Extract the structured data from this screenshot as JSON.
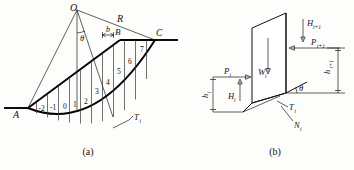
{
  "figure": {
    "title_a": "(a)",
    "title_b": "(b)"
  },
  "panel_a": {
    "caption": "(a)",
    "points": {
      "center": "O",
      "toe": "A",
      "crest_break": "B",
      "crest_top": "C"
    },
    "labels": {
      "radius": "R",
      "angle": "θ",
      "slice_width": "b",
      "shear_force": "T",
      "shear_force_sub": "i"
    },
    "slice_numbers": [
      "-2",
      "-1",
      "0",
      "1",
      "2",
      "3",
      "4",
      "5",
      "6",
      "7"
    ]
  },
  "panel_b": {
    "caption": "(b)",
    "forces": [
      {
        "symbol": "H",
        "sub": "i+1",
        "name": "horizontal-force-right"
      },
      {
        "symbol": "P",
        "sub": "i+1",
        "name": "interslice-force-right"
      },
      {
        "symbol": "h",
        "sub": "i+1",
        "name": "height-right"
      },
      {
        "symbol": "P",
        "sub": "i",
        "name": "interslice-force-left"
      },
      {
        "symbol": "h",
        "sub": "i",
        "name": "height-left"
      },
      {
        "symbol": "H",
        "sub": "i",
        "name": "horizontal-force-left"
      },
      {
        "symbol": "W",
        "sub": "i",
        "name": "weight"
      },
      {
        "symbol": "T",
        "sub": "i",
        "name": "shear-force"
      },
      {
        "symbol": "N",
        "sub": "i",
        "name": "normal-force"
      },
      {
        "symbol": "θ",
        "sub": "",
        "name": "base-inclination-angle"
      }
    ]
  },
  "colors": {
    "line": "#111111",
    "background": "#fdfdfb",
    "slice_line": "#333333"
  }
}
